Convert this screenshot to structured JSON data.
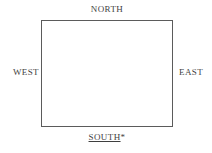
{
  "diagram": {
    "type": "compass-orientation-box",
    "background_color": "#ffffff",
    "box": {
      "name": "central-rectangle",
      "border_color": "#5b5b5b",
      "fill_color": "#ffffff",
      "x": 41,
      "y": 20,
      "width": 132,
      "height": 107
    },
    "labels": {
      "north": "NORTH",
      "west": "WEST",
      "east": "EAST",
      "south": "SOUTH",
      "south_marker": "*"
    },
    "text_color": "#3f3f3f"
  }
}
